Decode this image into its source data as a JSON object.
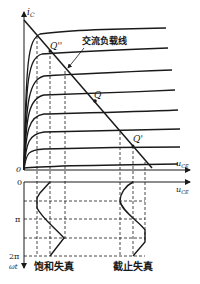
{
  "diagram": {
    "type": "transistor output characteristics with AC load line and distortion waveforms",
    "upper_plot": {
      "y_axis_label": "i",
      "y_axis_subscript": "C",
      "x_axis_label": "u",
      "x_axis_subscript": "CE",
      "origin_label": "0",
      "load_line_label": "交流负载线",
      "points": [
        {
          "label": "Q''",
          "desc": "near saturation"
        },
        {
          "label": "Q",
          "desc": "operating point"
        },
        {
          "label": "Q'",
          "desc": "near cutoff"
        }
      ]
    },
    "lower_plot": {
      "x_axis_label": "u",
      "x_axis_subscript": "CE",
      "y_axis_label": "ωt",
      "ticks": [
        "0",
        "π",
        "2π"
      ],
      "waveform_labels": [
        "饱和失真",
        "截止失真"
      ]
    },
    "colors": {
      "ink": "#1a1a1a",
      "background": "#ffffff"
    }
  }
}
